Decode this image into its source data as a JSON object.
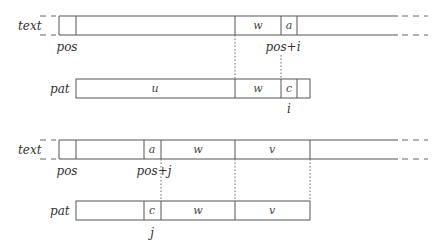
{
  "diagram": {
    "top": {
      "text_row": {
        "label": "text",
        "cells": [
          "",
          "",
          "w",
          "a"
        ],
        "pos_label": "pos",
        "index_label": "pos+i"
      },
      "pat_row": {
        "label": "pat",
        "cells": [
          "u",
          "w",
          "c",
          ""
        ],
        "index_label": "i"
      }
    },
    "bottom": {
      "text_row": {
        "label": "text",
        "cells": [
          "",
          "",
          "a",
          "w",
          "v"
        ],
        "pos_label": "pos",
        "index_label": "pos+j"
      },
      "pat_row": {
        "label": "pat",
        "cells": [
          "",
          "c",
          "w",
          "v"
        ],
        "index_label": "j"
      }
    }
  }
}
